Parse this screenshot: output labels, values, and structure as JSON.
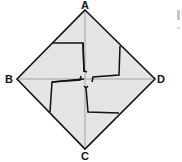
{
  "diagram": {
    "labels": {
      "A": "A",
      "B": "B",
      "C": "C",
      "D": "D"
    },
    "colors": {
      "fill": "#e6e6e6",
      "stroke": "#111111",
      "guide": "#8a8a8a"
    }
  }
}
